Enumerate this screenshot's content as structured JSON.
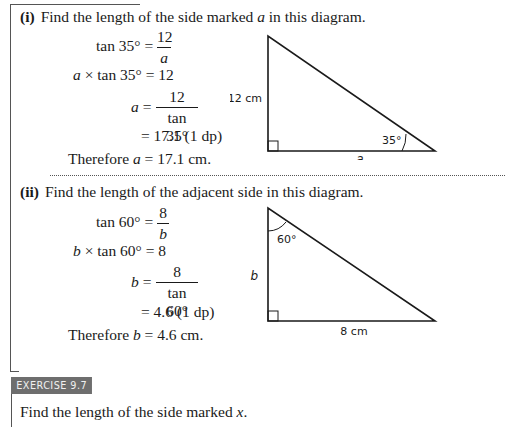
{
  "part_i": {
    "label": "(i)",
    "prompt": "Find the length of the side marked a in this diagram.",
    "prompt_pre": "Find the length of the side marked ",
    "prompt_var": "a",
    "prompt_post": " in this diagram.",
    "steps": {
      "s1_lhs": "tan 35° =",
      "s1_num": "12",
      "s1_den": "a",
      "s2_var": "a",
      "s2_rest": " × tan 35° = 12",
      "s3_lhs_var": "a",
      "s3_eq": " =",
      "s3_num": "12",
      "s3_den": "tan 35°",
      "s4": "= 17.1 (1 dp)",
      "conclusion_pre": "Therefore ",
      "conclusion_var": "a",
      "conclusion_post": " = 17.1 cm."
    },
    "diagram": {
      "side_label_vertical": "12 cm",
      "side_label_base": "a",
      "angle_label": "35°"
    }
  },
  "part_ii": {
    "label": "(ii)",
    "prompt": "Find the length of the adjacent side in this diagram.",
    "steps": {
      "s1_lhs": "tan 60° =",
      "s1_num": "8",
      "s1_den": "b",
      "s2_var": "b",
      "s2_rest": " × tan 60° = 8",
      "s3_lhs_var": "b",
      "s3_eq": " =",
      "s3_num": "8",
      "s3_den": "tan 60°",
      "s4": "= 4.6 (1 dp)",
      "conclusion_pre": "Therefore ",
      "conclusion_var": "b",
      "conclusion_post": " = 4.6 cm."
    },
    "diagram": {
      "side_label_vertical": "b",
      "side_label_base": "8 cm",
      "angle_label": "60°"
    }
  },
  "exercise": {
    "badge": "EXERCISE 9.7",
    "prompt_pre": "Find the length of the side marked ",
    "prompt_var": "x",
    "prompt_post": "."
  },
  "colors": {
    "badge_bg": "#6e6e6e",
    "badge_text": "#f0f0f0",
    "ink": "#1a1a1a"
  }
}
